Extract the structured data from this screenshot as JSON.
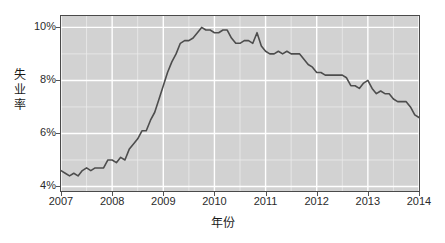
{
  "chart_data": {
    "type": "line",
    "title": "",
    "xlabel": "年份",
    "ylabel": "失业率",
    "ylabel_chars": "失\n业\n率",
    "xlim": [
      2007.0,
      2014.0
    ],
    "ylim": [
      3.83,
      10.43
    ],
    "grid": true,
    "legend": "none",
    "line_color": "#4d4d4d",
    "panel_color": "#d2d2d2",
    "grid_major_color": "#ffffff",
    "grid_minor_color": "#ebebeb",
    "x_ticks": [
      {
        "value": 2007,
        "label": "2007"
      },
      {
        "value": 2008,
        "label": "2008"
      },
      {
        "value": 2009,
        "label": "2009"
      },
      {
        "value": 2010,
        "label": "2010"
      },
      {
        "value": 2011,
        "label": "2011"
      },
      {
        "value": 2012,
        "label": "2012"
      },
      {
        "value": 2013,
        "label": "2013"
      },
      {
        "value": 2014,
        "label": "2014"
      }
    ],
    "y_ticks": [
      {
        "value": 4,
        "label": "4%"
      },
      {
        "value": 6,
        "label": "6%"
      },
      {
        "value": 8,
        "label": "8%"
      },
      {
        "value": 10,
        "label": "10%"
      }
    ],
    "x_minor_ticks": [
      2007.5,
      2008.5,
      2009.5,
      2010.5,
      2011.5,
      2012.5,
      2013.5
    ],
    "y_minor_ticks": [
      5,
      7,
      9
    ],
    "series": [
      {
        "name": "失业率",
        "x": [
          2007.0,
          2007.083,
          2007.167,
          2007.25,
          2007.333,
          2007.417,
          2007.5,
          2007.583,
          2007.667,
          2007.75,
          2007.833,
          2007.917,
          2008.0,
          2008.083,
          2008.167,
          2008.25,
          2008.333,
          2008.417,
          2008.5,
          2008.583,
          2008.667,
          2008.75,
          2008.833,
          2008.917,
          2009.0,
          2009.083,
          2009.167,
          2009.25,
          2009.333,
          2009.417,
          2009.5,
          2009.583,
          2009.667,
          2009.75,
          2009.833,
          2009.917,
          2010.0,
          2010.083,
          2010.167,
          2010.25,
          2010.333,
          2010.417,
          2010.5,
          2010.583,
          2010.667,
          2010.75,
          2010.833,
          2010.917,
          2011.0,
          2011.083,
          2011.167,
          2011.25,
          2011.333,
          2011.417,
          2011.5,
          2011.583,
          2011.667,
          2011.75,
          2011.833,
          2011.917,
          2012.0,
          2012.083,
          2012.167,
          2012.25,
          2012.333,
          2012.417,
          2012.5,
          2012.583,
          2012.667,
          2012.75,
          2012.833,
          2012.917,
          2013.0,
          2013.083,
          2013.167,
          2013.25,
          2013.333,
          2013.417,
          2013.5,
          2013.583,
          2013.667,
          2013.75,
          2013.833,
          2013.917,
          2014.0
        ],
        "y": [
          4.6,
          4.5,
          4.4,
          4.5,
          4.4,
          4.6,
          4.7,
          4.6,
          4.7,
          4.7,
          4.7,
          5.0,
          5.0,
          4.9,
          5.1,
          5.0,
          5.4,
          5.6,
          5.8,
          6.1,
          6.1,
          6.5,
          6.8,
          7.3,
          7.8,
          8.3,
          8.7,
          9.0,
          9.4,
          9.5,
          9.5,
          9.6,
          9.8,
          10.0,
          9.9,
          9.9,
          9.8,
          9.8,
          9.9,
          9.9,
          9.6,
          9.4,
          9.4,
          9.5,
          9.5,
          9.4,
          9.8,
          9.3,
          9.1,
          9.0,
          9.0,
          9.1,
          9.0,
          9.1,
          9.0,
          9.0,
          9.0,
          8.8,
          8.6,
          8.5,
          8.3,
          8.3,
          8.2,
          8.2,
          8.2,
          8.2,
          8.2,
          8.1,
          7.8,
          7.8,
          7.7,
          7.9,
          8.0,
          7.7,
          7.5,
          7.6,
          7.5,
          7.5,
          7.3,
          7.2,
          7.2,
          7.2,
          7.0,
          6.7,
          6.6
        ]
      }
    ]
  }
}
